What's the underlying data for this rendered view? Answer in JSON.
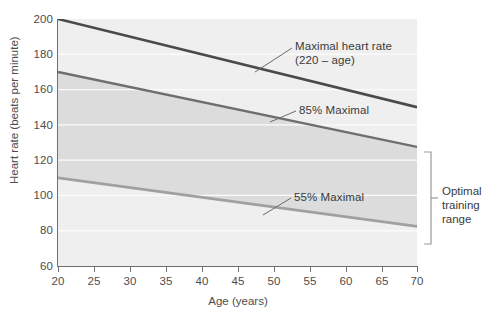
{
  "chart_data": {
    "type": "line",
    "title": "",
    "xlabel": "Age (years)",
    "ylabel": "Heart rate (beats per minute)",
    "xlim": [
      20,
      70
    ],
    "ylim": [
      60,
      200
    ],
    "xticks": [
      20,
      25,
      30,
      35,
      40,
      45,
      50,
      55,
      60,
      65,
      70
    ],
    "yticks": [
      60,
      80,
      100,
      120,
      140,
      160,
      180,
      200
    ],
    "grid": true,
    "legend_position": "inline-annotations",
    "x": [
      20,
      70
    ],
    "series": [
      {
        "name": "Maximal heart rate (220 - age)",
        "values": [
          200,
          150
        ],
        "color": "#4a4a4a",
        "width": 2.6
      },
      {
        "name": "85% Maximal",
        "values": [
          170,
          127.5
        ],
        "color": "#6e6e6e",
        "width": 2.4
      },
      {
        "name": "55% Maximal",
        "values": [
          110,
          82.5
        ],
        "color": "#a0a0a0",
        "width": 2.8
      }
    ],
    "shaded_band": {
      "label": "Optimal training range",
      "upper_series": "85% Maximal",
      "lower_series": "55% Maximal",
      "color": "#dcdcdc"
    },
    "annotations": [
      {
        "text_line1": "Maximal heart rate",
        "text_line2": "(220 – age)"
      },
      {
        "text_line1": "85% Maximal",
        "text_line2": ""
      },
      {
        "text_line1": "55% Maximal",
        "text_line2": ""
      }
    ]
  },
  "axis": {
    "y_label": "Heart rate (beats per minute)",
    "x_label": "Age (years)",
    "y_ticks": [
      "200",
      "180",
      "160",
      "140",
      "120",
      "100",
      "80",
      "60"
    ],
    "x_ticks": [
      "20",
      "25",
      "30",
      "35",
      "40",
      "45",
      "50",
      "55",
      "60",
      "65",
      "70"
    ]
  },
  "annotations": {
    "max_hr_line1": "Maximal heart rate",
    "max_hr_line2": "(220 – age)",
    "pct85": "85% Maximal",
    "pct55": "55% Maximal",
    "bracket_line1": "Optimal",
    "bracket_line2": "training",
    "bracket_line3": "range"
  },
  "colors": {
    "plot_background": "#efefef",
    "band_fill": "#dcdcdc",
    "gridline": "#fbfbfb",
    "axis": "#6f6f6f",
    "max_line": "#4a4a4a",
    "line_85": "#6e6e6e",
    "line_55": "#a0a0a0",
    "text": "#4d4d4d"
  }
}
